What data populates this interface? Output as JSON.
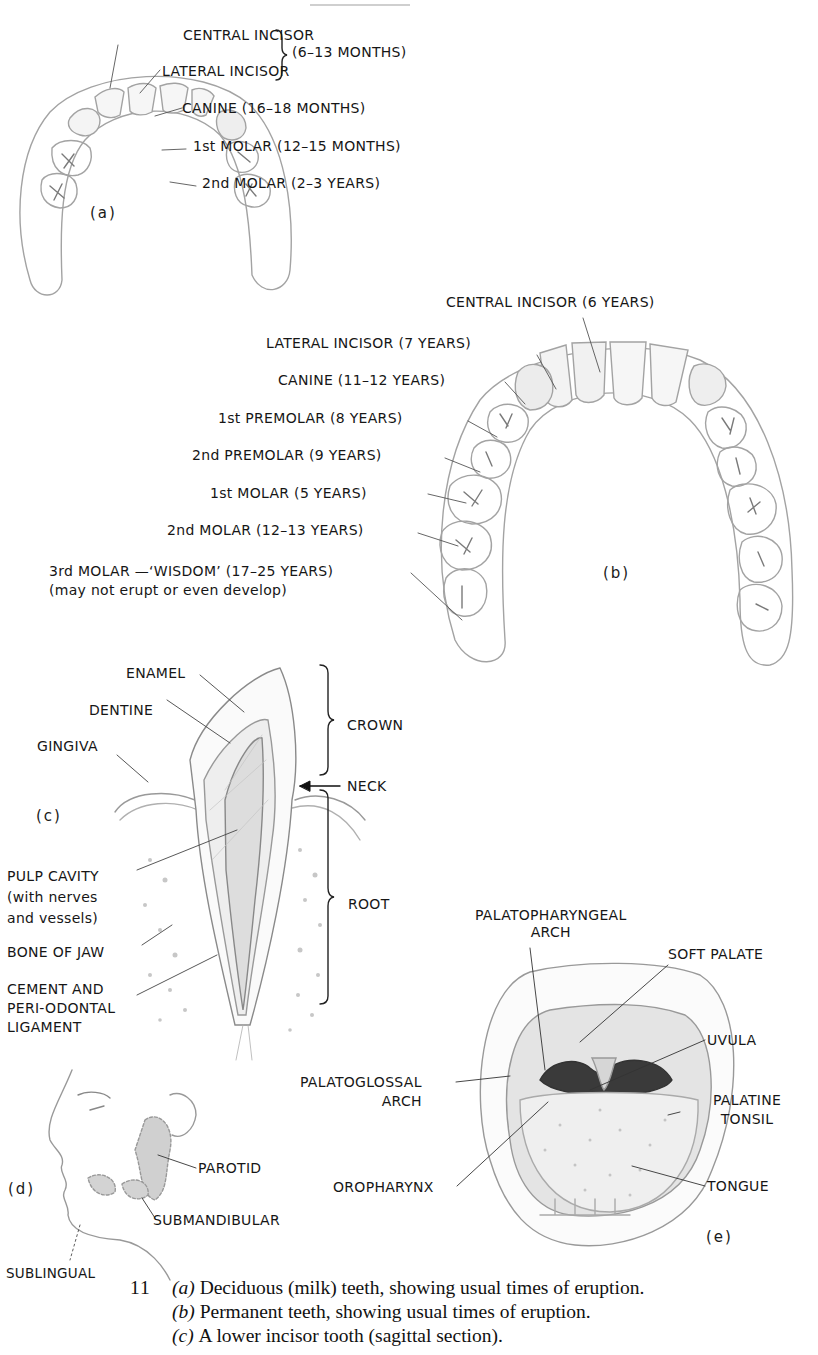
{
  "figure": {
    "number": "11",
    "heading_partial": "TEETH"
  },
  "panel_a": {
    "tag": "(a)",
    "labels": {
      "central_incisor": "CENTRAL INCISOR",
      "lateral_incisor": "LATERAL INCISOR",
      "incisors_time": "(6–13 MONTHS)",
      "canine": "CANINE (16–18 MONTHS)",
      "first_molar": "1st MOLAR (12–15 MONTHS)",
      "second_molar": "2nd MOLAR (2–3 YEARS)"
    }
  },
  "panel_b": {
    "tag": "(b)",
    "labels": {
      "central_incisor": "CENTRAL INCISOR (6 YEARS)",
      "lateral_incisor": "LATERAL INCISOR (7 YEARS)",
      "canine": "CANINE (11–12 YEARS)",
      "first_premolar": "1st PREMOLAR (8 YEARS)",
      "second_premolar": "2nd PREMOLAR (9 YEARS)",
      "first_molar": "1st MOLAR (5 YEARS)",
      "second_molar": "2nd MOLAR (12–13 YEARS)",
      "third_molar": "3rd MOLAR —‘WISDOM’ (17–25 YEARS)",
      "third_molar_note": "(may not erupt or even develop)"
    }
  },
  "panel_c": {
    "tag": "(c)",
    "labels": {
      "enamel": "ENAMEL",
      "dentine": "DENTINE",
      "gingiva": "GINGIVA",
      "crown": "CROWN",
      "neck": "NECK",
      "root": "ROOT",
      "pulp_cavity": "PULP CAVITY\n(with nerves\nand vessels)",
      "bone_of_jaw": "BONE OF JAW",
      "cement": "CEMENT AND\nPERI-ODONTAL\nLIGAMENT"
    }
  },
  "panel_d": {
    "tag": "(d)",
    "labels": {
      "parotid": "PAROTID",
      "submandibular": "SUBMANDIBULAR",
      "sublingual": "SUBLINGUAL"
    }
  },
  "panel_e": {
    "tag": "(e)",
    "labels": {
      "palatopharyngeal_arch": "PALATOPHARYNGEAL\nARCH",
      "soft_palate": "SOFT PALATE",
      "uvula": "UVULA",
      "palatoglossal_arch": "PALATOGLOSSAL\nARCH",
      "palatine_tonsil": "PALATINE\nTONSIL",
      "oropharynx": "OROPHARYNX",
      "tongue": "TONGUE"
    }
  },
  "caption": {
    "number": "11",
    "lines": [
      {
        "tag": "(a)",
        "text": "Deciduous (milk) teeth, showing usual times of eruption."
      },
      {
        "tag": "(b)",
        "text": "Permanent teeth, showing usual times of eruption."
      },
      {
        "tag": "(c)",
        "text": "A lower incisor tooth (sagittal section)."
      }
    ]
  },
  "colors": {
    "ink": "#161616",
    "line_art": "#9a9a9a",
    "shade": "#c8c8c8",
    "dark_throat": "#3a3a3a"
  }
}
